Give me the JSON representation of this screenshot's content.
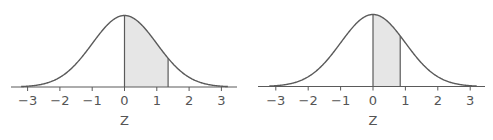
{
  "chart_data": [
    {
      "type": "area",
      "title": "",
      "description": "Standard normal curve with area shaded from z = 0 to z ≈ 1.35",
      "xlabel": "Z",
      "ylabel": "",
      "xlim": [
        -3.5,
        3.5
      ],
      "ticks": [
        -3,
        -2,
        -1,
        0,
        1,
        2,
        3
      ],
      "tick_labels": [
        "−3",
        "−2",
        "−1",
        "0",
        "1",
        "2",
        "3"
      ],
      "shaded_region": {
        "from": 0,
        "to": 1.35
      },
      "grid": false,
      "legend": false
    },
    {
      "type": "area",
      "title": "",
      "description": "Standard normal curve with area shaded from z = 0 to z ≈ 0.84",
      "xlabel": "Z",
      "ylabel": "",
      "xlim": [
        -3.5,
        3.5
      ],
      "ticks": [
        -3,
        -2,
        -1,
        0,
        1,
        2,
        3
      ],
      "tick_labels": [
        "−3",
        "−2",
        "−1",
        "0",
        "1",
        "2",
        "3"
      ],
      "shaded_region": {
        "from": 0,
        "to": 0.84
      },
      "grid": false,
      "legend": false
    }
  ],
  "colors": {
    "curve": "#5a5a5a",
    "axis": "#5a5a5a",
    "shade": "#e6e6e6",
    "text": "#555555"
  },
  "layout": [
    {
      "x0": 124.5,
      "unit": 32.3,
      "axis_y": 87,
      "peak_y": 15.5,
      "axis_start": 11,
      "axis_end": 237,
      "curve_start_z": -3.2,
      "curve_end_z": 3.2
    },
    {
      "x0": 373,
      "unit": 32.4,
      "axis_y": 86.5,
      "peak_y": 14.5,
      "axis_start": 258,
      "axis_end": 485,
      "curve_start_z": -3.2,
      "curve_end_z": 3.2
    }
  ]
}
